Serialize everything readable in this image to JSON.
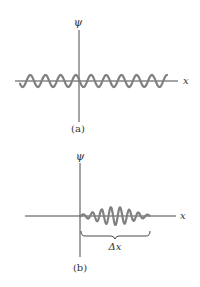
{
  "figure": {
    "panels": [
      {
        "id": "a",
        "caption": "(a)",
        "y_axis_label": "ψ",
        "x_axis_label": "x",
        "description": "infinite sinusoidal wave of constant amplitude"
      },
      {
        "id": "b",
        "caption": "(b)",
        "y_axis_label": "ψ",
        "x_axis_label": "x",
        "bracket_label": "Δx",
        "description": "localized wave packet of finite extent Δx"
      }
    ],
    "colors": {
      "axis": "#333333",
      "wave": "#808080"
    }
  }
}
